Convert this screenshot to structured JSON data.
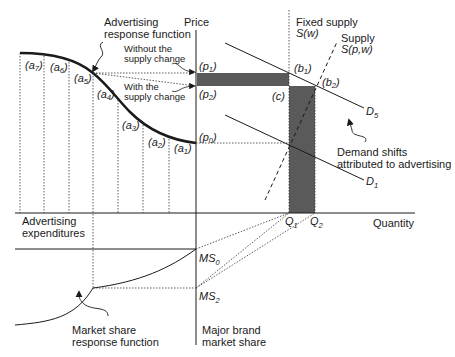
{
  "diagram": {
    "axes": {
      "price": "Price",
      "quantity": "Quantity",
      "advertising": [
        "Advertising",
        "expenditures"
      ],
      "market_share": [
        "Major brand",
        "market share"
      ]
    },
    "annotations": {
      "advertising_response": [
        "Advertising",
        "response function"
      ],
      "without_supply": [
        "Without the",
        "supply change"
      ],
      "with_supply": [
        "With the",
        "supply change"
      ],
      "fixed_supply": [
        "Fixed supply",
        "S(w)"
      ],
      "supply": [
        "Supply",
        "S(p,w)"
      ],
      "demand_shifts": [
        "Demand shifts",
        "attributed to advertising"
      ],
      "market_share_response": [
        "Market share",
        "response function"
      ]
    },
    "points": {
      "a": [
        "(a7)",
        "(a6)",
        "(a5)",
        "(a4)",
        "(a3)",
        "(a2)",
        "(a1)"
      ],
      "prices": {
        "p1": "(p1)",
        "p2": "(p2)",
        "p0": "(p0)"
      },
      "b1": "(b1)",
      "b2": "(b2)",
      "c": "(c)",
      "q1": "Q1",
      "q2": "Q2",
      "ms0": "MS0",
      "ms2": "MS2",
      "d5": "D5",
      "d1": "D1"
    },
    "colors": {
      "line": "#1a1a1a",
      "shade": "#5a5a5a"
    }
  }
}
